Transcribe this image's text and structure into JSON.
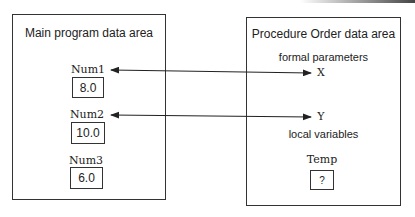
{
  "main_area": {
    "title": "Main program data area",
    "variables": [
      {
        "name": "Num1",
        "value": "8.0"
      },
      {
        "name": "Num2",
        "value": "10.0"
      },
      {
        "name": "Num3",
        "value": "6.0"
      }
    ]
  },
  "procedure_area": {
    "title": "Procedure Order data area",
    "formal_parameters_label": "formal parameters",
    "formal_parameters": [
      "X",
      "Y"
    ],
    "local_variables_label": "local variables",
    "local_variables": [
      {
        "name": "Temp",
        "value": "?"
      }
    ]
  },
  "arrows": [
    {
      "from": "Num1",
      "to": "X",
      "style": "double-headed"
    },
    {
      "from": "Num2",
      "to": "Y",
      "style": "double-headed"
    }
  ]
}
